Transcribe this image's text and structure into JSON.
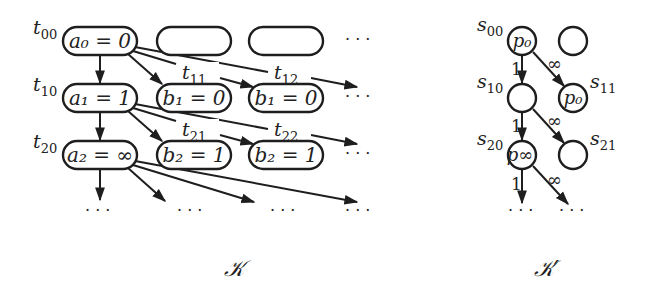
{
  "diagram_K": {
    "caption": "𝒦",
    "row_labels": [
      "t00",
      "t10",
      "t20"
    ],
    "nodes": [
      {
        "id": "a0",
        "text": "a₀ = 0"
      },
      {
        "id": "empty01",
        "text": ""
      },
      {
        "id": "empty02",
        "text": ""
      },
      {
        "id": "a1",
        "text": "a₁ = 1"
      },
      {
        "id": "b1_col2",
        "text": "b₁ = 0"
      },
      {
        "id": "b1_col3",
        "text": "b₁ = 0"
      },
      {
        "id": "a2",
        "text": "a₂ = ∞"
      },
      {
        "id": "b2_col2",
        "text": "b₂ = 1"
      },
      {
        "id": "b2_col3",
        "text": "b₂ = 1"
      }
    ],
    "edge_labels": [
      "t11",
      "t12",
      "t21",
      "t22"
    ],
    "ellipsis": "· · ·"
  },
  "diagram_K_prime": {
    "caption": "𝒦′",
    "row_labels": [
      "s00",
      "s10",
      "s20"
    ],
    "side_labels": [
      "s11",
      "s21"
    ],
    "nodes": [
      {
        "id": "s00",
        "text": "p₀"
      },
      {
        "id": "s01",
        "text": ""
      },
      {
        "id": "s10",
        "text": ""
      },
      {
        "id": "s11",
        "text": "p₀"
      },
      {
        "id": "s20",
        "text": "p∞"
      },
      {
        "id": "s21",
        "text": ""
      }
    ],
    "edge_weights": {
      "down": "1",
      "diag": "∞"
    },
    "ellipsis": "· · ·"
  }
}
